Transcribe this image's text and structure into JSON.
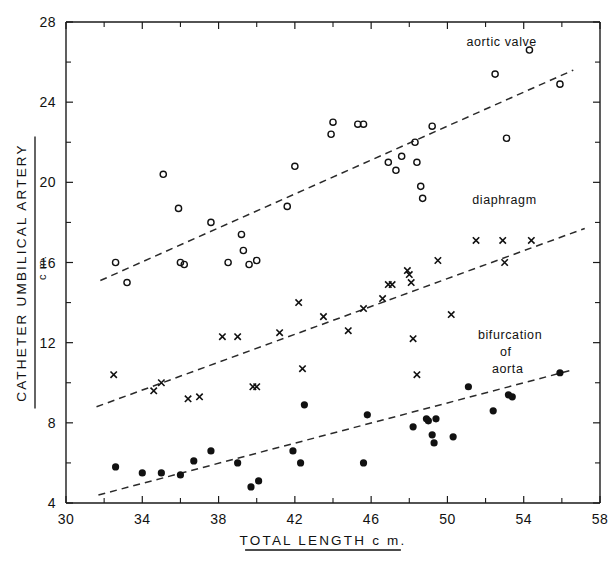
{
  "chart_data": {
    "type": "scatter",
    "title": "",
    "xlabel": "TOTAL LENGTH c m.",
    "xlabel_main": "TOTAL LENGTH",
    "xlabel_unit": "c m.",
    "ylabel": "CATHETER UMBILICAL ARTERY / c m.",
    "ylabel_numerator": "CATHETER UMBILICAL ARTERY",
    "ylabel_denominator": "c m.",
    "xlim": [
      30,
      58
    ],
    "ylim": [
      4,
      28
    ],
    "x_ticks": [
      30,
      34,
      38,
      42,
      46,
      50,
      54,
      58
    ],
    "x_tick_labels": [
      "30",
      "34",
      "38",
      "42",
      "46",
      "50",
      "54",
      "58"
    ],
    "x_minor_ticks": [
      32,
      36,
      40,
      44,
      48,
      52,
      56
    ],
    "y_ticks": [
      4,
      8,
      12,
      16,
      20,
      24,
      28
    ],
    "y_tick_labels": [
      "4",
      "8",
      "12",
      "16",
      "20",
      "24",
      "28"
    ],
    "y_minor_ticks": [
      6,
      10,
      14,
      18,
      22,
      26
    ],
    "grid": false,
    "legend_position": "inline-annotations",
    "series": [
      {
        "name": "aortic valve",
        "label": "aortic valve",
        "marker": "open-circle",
        "label_x": 51.0,
        "label_y": 26.8,
        "trendline": {
          "x1": 31.8,
          "y1": 15.1,
          "x2": 56.6,
          "y2": 25.6
        },
        "points": [
          [
            32.6,
            16.0
          ],
          [
            33.2,
            15.0
          ],
          [
            35.1,
            20.4
          ],
          [
            35.9,
            18.7
          ],
          [
            36.0,
            16.0
          ],
          [
            36.2,
            15.9
          ],
          [
            37.6,
            18.0
          ],
          [
            38.5,
            16.0
          ],
          [
            39.2,
            17.4
          ],
          [
            39.3,
            16.6
          ],
          [
            39.6,
            15.9
          ],
          [
            40.0,
            16.1
          ],
          [
            41.6,
            18.8
          ],
          [
            42.0,
            20.8
          ],
          [
            43.9,
            22.4
          ],
          [
            44.0,
            23.0
          ],
          [
            45.3,
            22.9
          ],
          [
            45.6,
            22.9
          ],
          [
            46.9,
            21.0
          ],
          [
            47.3,
            20.6
          ],
          [
            47.6,
            21.3
          ],
          [
            48.3,
            22.0
          ],
          [
            48.4,
            21.0
          ],
          [
            48.6,
            19.8
          ],
          [
            48.7,
            19.2
          ],
          [
            49.2,
            22.8
          ],
          [
            52.5,
            25.4
          ],
          [
            53.1,
            22.2
          ],
          [
            54.3,
            26.6
          ],
          [
            55.9,
            24.9
          ]
        ]
      },
      {
        "name": "diaphragm",
        "label": "diaphragm",
        "marker": "cross",
        "label_x": 51.3,
        "label_y": 18.9,
        "trendline": {
          "x1": 31.6,
          "y1": 8.8,
          "x2": 57.2,
          "y2": 17.7
        },
        "points": [
          [
            32.5,
            10.4
          ],
          [
            34.6,
            9.6
          ],
          [
            35.0,
            10.0
          ],
          [
            36.4,
            9.2
          ],
          [
            37.0,
            9.3
          ],
          [
            38.2,
            12.3
          ],
          [
            39.0,
            12.3
          ],
          [
            39.8,
            9.8
          ],
          [
            40.0,
            9.8
          ],
          [
            41.2,
            12.5
          ],
          [
            42.2,
            14.0
          ],
          [
            42.4,
            10.7
          ],
          [
            43.5,
            13.3
          ],
          [
            44.8,
            12.6
          ],
          [
            45.6,
            13.7
          ],
          [
            46.6,
            14.2
          ],
          [
            46.9,
            14.9
          ],
          [
            47.1,
            14.9
          ],
          [
            47.9,
            15.6
          ],
          [
            48.0,
            15.4
          ],
          [
            48.1,
            15.0
          ],
          [
            48.2,
            12.2
          ],
          [
            48.4,
            10.4
          ],
          [
            49.5,
            16.1
          ],
          [
            50.2,
            13.4
          ],
          [
            51.5,
            17.1
          ],
          [
            52.9,
            17.1
          ],
          [
            53.0,
            16.0
          ],
          [
            54.4,
            17.1
          ]
        ]
      },
      {
        "name": "bifurcation of aorta",
        "label_lines": [
          "bifurcation",
          "of",
          "aorta"
        ],
        "marker": "filled-circle",
        "label_x": 51.6,
        "label_y": 12.2,
        "trendline": {
          "x1": 31.7,
          "y1": 4.4,
          "x2": 56.4,
          "y2": 10.6
        },
        "points": [
          [
            32.6,
            5.8
          ],
          [
            34.0,
            5.5
          ],
          [
            35.0,
            5.5
          ],
          [
            36.0,
            5.4
          ],
          [
            36.7,
            6.1
          ],
          [
            37.6,
            6.6
          ],
          [
            39.0,
            6.0
          ],
          [
            39.7,
            4.8
          ],
          [
            40.1,
            5.1
          ],
          [
            41.9,
            6.6
          ],
          [
            42.3,
            6.0
          ],
          [
            42.5,
            8.9
          ],
          [
            45.6,
            6.0
          ],
          [
            45.8,
            8.4
          ],
          [
            48.2,
            7.8
          ],
          [
            48.9,
            8.2
          ],
          [
            49.0,
            8.1
          ],
          [
            49.2,
            7.4
          ],
          [
            49.3,
            7.0
          ],
          [
            49.4,
            8.2
          ],
          [
            50.3,
            7.3
          ],
          [
            51.1,
            9.8
          ],
          [
            52.4,
            8.6
          ],
          [
            53.2,
            9.4
          ],
          [
            53.4,
            9.3
          ],
          [
            55.9,
            10.5
          ]
        ]
      }
    ]
  },
  "figure": {
    "caption": ""
  }
}
